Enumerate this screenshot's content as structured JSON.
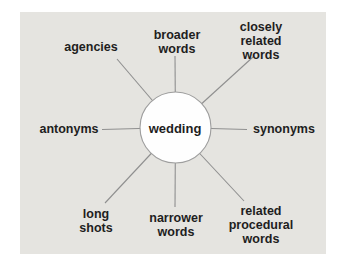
{
  "colors": {
    "page_background": "#ffffff",
    "panel_background": "#e5e4e0",
    "text": "#1e1e1e",
    "spoke_line": "#8f8f8f",
    "hub_fill": "#fefefe",
    "hub_stroke": "#9e9e9e"
  },
  "diagram": {
    "type": "radial-word-map",
    "center_label": "wedding",
    "nodes": [
      {
        "id": "agencies",
        "position": "upper-left",
        "label": "agencies"
      },
      {
        "id": "broader-words",
        "position": "top",
        "label": "broader\nwords"
      },
      {
        "id": "closely-related-words",
        "position": "upper-right",
        "label": "closely related\nwords"
      },
      {
        "id": "synonyms",
        "position": "right",
        "label": "synonyms"
      },
      {
        "id": "related-procedural-words",
        "position": "lower-right",
        "label": "related\nprocedural\nwords"
      },
      {
        "id": "narrower-words",
        "position": "bottom",
        "label": "narrower\nwords"
      },
      {
        "id": "long-shots",
        "position": "lower-left",
        "label": "long\nshots"
      },
      {
        "id": "antonyms",
        "position": "left",
        "label": "antonyms"
      }
    ]
  }
}
